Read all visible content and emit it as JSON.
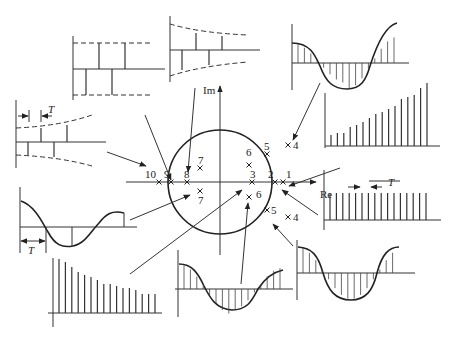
{
  "axes": {
    "real_label": "Re",
    "imag_label": "Im"
  },
  "period_label": "T",
  "unit_circle": {
    "center": [
      220,
      182
    ],
    "radius": 52
  },
  "poles": [
    {
      "id": "1",
      "label": "1",
      "x": 283,
      "y": 182,
      "lx": 286,
      "ly": 178
    },
    {
      "id": "2",
      "label": "2",
      "x": 275,
      "y": 182,
      "lx": 268,
      "ly": 178
    },
    {
      "id": "3",
      "label": "3",
      "x": 252,
      "y": 182,
      "lx": 250,
      "ly": 178
    },
    {
      "id": "4a",
      "label": "4",
      "x": 288,
      "y": 145,
      "lx": 293,
      "ly": 149
    },
    {
      "id": "4b",
      "label": "4",
      "x": 288,
      "y": 217,
      "lx": 293,
      "ly": 221
    },
    {
      "id": "5a",
      "label": "5",
      "x": 267,
      "y": 154,
      "lx": 264,
      "ly": 150
    },
    {
      "id": "5b",
      "label": "5",
      "x": 267,
      "y": 210,
      "lx": 271,
      "ly": 214
    },
    {
      "id": "6a",
      "label": "6",
      "x": 249,
      "y": 165,
      "lx": 246,
      "ly": 156
    },
    {
      "id": "6b",
      "label": "6",
      "x": 249,
      "y": 197,
      "lx": 256,
      "ly": 198
    },
    {
      "id": "7a",
      "label": "7",
      "x": 200,
      "y": 168,
      "lx": 198,
      "ly": 164
    },
    {
      "id": "7b",
      "label": "7",
      "x": 200,
      "y": 191,
      "lx": 198,
      "ly": 204
    },
    {
      "id": "8",
      "label": "8",
      "x": 187,
      "y": 182,
      "lx": 184,
      "ly": 178
    },
    {
      "id": "9",
      "label": "9",
      "x": 171,
      "y": 182,
      "lx": 164,
      "ly": 178
    },
    {
      "id": "10",
      "label": "10",
      "x": 159,
      "y": 182,
      "lx": 145,
      "ly": 178
    }
  ],
  "responses": [
    {
      "name": "alternating-constant",
      "pole": "9"
    },
    {
      "name": "alternating-decaying",
      "pole": "10"
    },
    {
      "name": "alternating-growing",
      "pole": "7"
    },
    {
      "name": "growing-oscillation",
      "pole": "4"
    },
    {
      "name": "growing-sequence",
      "pole": "1"
    },
    {
      "name": "constant-sequence",
      "pole": "2"
    },
    {
      "name": "damped-cosine-sampled",
      "pole": "7"
    },
    {
      "name": "decaying-sequence",
      "pole": "3"
    },
    {
      "name": "decaying-oscillation",
      "pole": "6"
    },
    {
      "name": "constant-oscillation",
      "pole": "5"
    }
  ]
}
